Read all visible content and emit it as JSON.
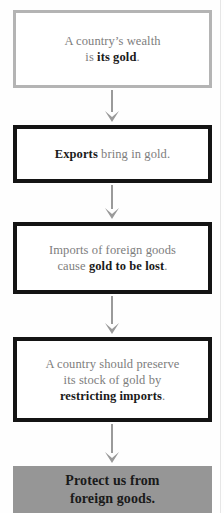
{
  "diagram": {
    "type": "flowchart",
    "orientation": "vertical",
    "background_color": "#fefefe",
    "nodes": [
      {
        "id": "box-1",
        "style": "light-outline",
        "border_color": "#b4b4b4",
        "fill_color": "#ffffff",
        "text_plain": "A country's wealth is its gold.",
        "lines": [
          {
            "segments": [
              {
                "text": "A country’s wealth",
                "bold": false
              }
            ]
          },
          {
            "segments": [
              {
                "text": "is ",
                "bold": false
              },
              {
                "text": "its gold",
                "bold": true
              },
              {
                "text": ".",
                "bold": false
              }
            ]
          }
        ]
      },
      {
        "id": "box-2",
        "style": "heavy-outline",
        "border_color": "#141414",
        "fill_color": "#ffffff",
        "text_plain": "Exports bring in gold.",
        "lines": [
          {
            "segments": [
              {
                "text": "Exports",
                "bold": true
              },
              {
                "text": " bring in gold.",
                "bold": false
              }
            ]
          }
        ]
      },
      {
        "id": "box-3",
        "style": "heavy-outline",
        "border_color": "#141414",
        "fill_color": "#ffffff",
        "text_plain": "Imports of foreign goods cause gold to be lost.",
        "lines": [
          {
            "segments": [
              {
                "text": "Imports of foreign goods",
                "bold": false
              }
            ]
          },
          {
            "segments": [
              {
                "text": "cause ",
                "bold": false
              },
              {
                "text": "gold to be lost",
                "bold": true
              },
              {
                "text": ".",
                "bold": false
              }
            ]
          }
        ]
      },
      {
        "id": "box-4",
        "style": "heavy-outline",
        "border_color": "#141414",
        "fill_color": "#ffffff",
        "text_plain": "A country should preserve its stock of gold by restricting imports.",
        "lines": [
          {
            "segments": [
              {
                "text": "A country should preserve",
                "bold": false
              }
            ]
          },
          {
            "segments": [
              {
                "text": "its stock of gold by",
                "bold": false
              }
            ]
          },
          {
            "segments": [
              {
                "text": "restricting imports",
                "bold": true
              },
              {
                "text": ".",
                "bold": false
              }
            ]
          }
        ]
      },
      {
        "id": "box-5",
        "style": "solid-fill",
        "border_color": "none",
        "fill_color": "#969696",
        "text_plain": "Protect us from foreign goods.",
        "lines": [
          {
            "segments": [
              {
                "text": "Protect us from",
                "bold": true
              }
            ]
          },
          {
            "segments": [
              {
                "text": "foreign goods.",
                "bold": true
              }
            ]
          }
        ]
      }
    ],
    "connectors": [
      {
        "id": "arrow-1",
        "from": "box-1",
        "to": "box-2",
        "direction": "down",
        "color": "#9a9a9a"
      },
      {
        "id": "arrow-2",
        "from": "box-2",
        "to": "box-3",
        "direction": "down",
        "color": "#9a9a9a"
      },
      {
        "id": "arrow-3",
        "from": "box-3",
        "to": "box-4",
        "direction": "down",
        "color": "#9a9a9a"
      },
      {
        "id": "arrow-4",
        "from": "box-4",
        "to": "box-5",
        "direction": "down",
        "color": "#9a9a9a"
      }
    ]
  }
}
